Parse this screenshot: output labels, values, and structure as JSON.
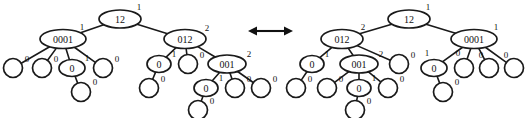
{
  "figure": {
    "background_color": "#ffffff",
    "stroke_color": "#1a1a1a",
    "text_color": "#111111",
    "width": 526,
    "height": 118
  },
  "relation_arrow": {
    "name": "double-headed-arrow",
    "label": "",
    "x1": 248,
    "x2": 293,
    "y": 31,
    "head_size": 7
  },
  "trees": [
    {
      "id": "left-tree",
      "name": "left-tree",
      "root_id": "L0",
      "nodes": [
        {
          "id": "L0",
          "label": "12",
          "shape": "ellipse",
          "cx": 120,
          "cy": 19,
          "rx": 21,
          "ry": 9,
          "edge_label": "1",
          "edge_label_x": 139,
          "edge_label_y": 7
        },
        {
          "id": "L1",
          "label": "0001",
          "shape": "ellipse",
          "cx": 63,
          "cy": 39,
          "rx": 23,
          "ry": 9.5,
          "edge_label": "1",
          "edge_label_x": 82,
          "edge_label_y": 27
        },
        {
          "id": "L2",
          "label": "012",
          "shape": "ellipse",
          "cx": 185,
          "cy": 39,
          "rx": 21,
          "ry": 9.5,
          "edge_label": "2",
          "edge_label_x": 207,
          "edge_label_y": 28
        },
        {
          "id": "L3",
          "label": "",
          "shape": "circle",
          "cx": 13,
          "cy": 68,
          "rx": 9.5,
          "ry": 9.5,
          "edge_label": "0",
          "edge_label_x": 27,
          "edge_label_y": 59
        },
        {
          "id": "L4",
          "label": "",
          "shape": "circle",
          "cx": 42,
          "cy": 68,
          "rx": 9.5,
          "ry": 9.5,
          "edge_label": "0",
          "edge_label_x": 56,
          "edge_label_y": 59
        },
        {
          "id": "L5",
          "label": "0",
          "shape": "ellipse",
          "cx": 72,
          "cy": 68,
          "rx": 13,
          "ry": 8.5,
          "edge_label": "1",
          "edge_label_x": 87,
          "edge_label_y": 58
        },
        {
          "id": "L6",
          "label": "",
          "shape": "circle",
          "cx": 103,
          "cy": 68,
          "rx": 9.5,
          "ry": 9.5,
          "edge_label": "0",
          "edge_label_x": 117,
          "edge_label_y": 59
        },
        {
          "id": "L7",
          "label": "",
          "shape": "circle",
          "cx": 81,
          "cy": 92,
          "rx": 9.5,
          "ry": 9.5,
          "edge_label": "0",
          "edge_label_x": 95,
          "edge_label_y": 82
        },
        {
          "id": "L8",
          "label": "0",
          "shape": "ellipse",
          "cx": 159,
          "cy": 64,
          "rx": 12,
          "ry": 8.5,
          "edge_label": "1",
          "edge_label_x": 174,
          "edge_label_y": 54
        },
        {
          "id": "L9",
          "label": "",
          "shape": "circle",
          "cx": 188,
          "cy": 64,
          "rx": 9.5,
          "ry": 9.5,
          "edge_label": "0",
          "edge_label_x": 202,
          "edge_label_y": 55
        },
        {
          "id": "L10",
          "label": "001",
          "shape": "ellipse",
          "cx": 227,
          "cy": 64,
          "rx": 19,
          "ry": 9,
          "edge_label": "2",
          "edge_label_x": 249,
          "edge_label_y": 54
        },
        {
          "id": "L11",
          "label": "",
          "shape": "circle",
          "cx": 149,
          "cy": 88,
          "rx": 9.5,
          "ry": 9.5,
          "edge_label": "0",
          "edge_label_x": 163,
          "edge_label_y": 79
        },
        {
          "id": "L12",
          "label": "0",
          "shape": "ellipse",
          "cx": 206,
          "cy": 88,
          "rx": 12,
          "ry": 8.5,
          "edge_label": "1",
          "edge_label_x": 221,
          "edge_label_y": 78
        },
        {
          "id": "L13",
          "label": "",
          "shape": "circle",
          "cx": 235,
          "cy": 88,
          "rx": 9.5,
          "ry": 9.5,
          "edge_label": "0",
          "edge_label_x": 249,
          "edge_label_y": 79
        },
        {
          "id": "L14",
          "label": "",
          "shape": "circle",
          "cx": 261,
          "cy": 88,
          "rx": 9.5,
          "ry": 9.5,
          "edge_label": "0",
          "edge_label_x": 275,
          "edge_label_y": 79
        },
        {
          "id": "L15",
          "label": "",
          "shape": "circle",
          "cx": 198,
          "cy": 110,
          "rx": 9.5,
          "ry": 9.5,
          "edge_label": "0",
          "edge_label_x": 212,
          "edge_label_y": 101
        }
      ],
      "edges": [
        {
          "from": "L0",
          "to": "L1"
        },
        {
          "from": "L0",
          "to": "L2"
        },
        {
          "from": "L1",
          "to": "L3"
        },
        {
          "from": "L1",
          "to": "L4"
        },
        {
          "from": "L1",
          "to": "L5"
        },
        {
          "from": "L1",
          "to": "L6"
        },
        {
          "from": "L5",
          "to": "L7"
        },
        {
          "from": "L2",
          "to": "L8"
        },
        {
          "from": "L2",
          "to": "L9"
        },
        {
          "from": "L2",
          "to": "L10"
        },
        {
          "from": "L8",
          "to": "L11"
        },
        {
          "from": "L10",
          "to": "L12"
        },
        {
          "from": "L10",
          "to": "L13"
        },
        {
          "from": "L10",
          "to": "L14"
        },
        {
          "from": "L12",
          "to": "L15"
        }
      ]
    },
    {
      "id": "right-tree",
      "name": "right-tree",
      "root_id": "R0",
      "nodes": [
        {
          "id": "R0",
          "label": "12",
          "shape": "ellipse",
          "cx": 409,
          "cy": 19,
          "rx": 21,
          "ry": 9,
          "edge_label": "1",
          "edge_label_x": 428,
          "edge_label_y": 7
        },
        {
          "id": "R1",
          "label": "012",
          "shape": "ellipse",
          "cx": 342,
          "cy": 39,
          "rx": 21,
          "ry": 9.5,
          "edge_label": "2",
          "edge_label_x": 363,
          "edge_label_y": 27
        },
        {
          "id": "R2",
          "label": "0001",
          "shape": "ellipse",
          "cx": 474,
          "cy": 39,
          "rx": 23,
          "ry": 9.5,
          "edge_label": "1",
          "edge_label_x": 496,
          "edge_label_y": 27
        },
        {
          "id": "R3",
          "label": "0",
          "shape": "ellipse",
          "cx": 312,
          "cy": 64,
          "rx": 12,
          "ry": 8.5,
          "edge_label": "1",
          "edge_label_x": 327,
          "edge_label_y": 54
        },
        {
          "id": "R4",
          "label": "001",
          "shape": "ellipse",
          "cx": 359,
          "cy": 64,
          "rx": 19,
          "ry": 9,
          "edge_label": "2",
          "edge_label_x": 381,
          "edge_label_y": 54
        },
        {
          "id": "R5",
          "label": "",
          "shape": "circle",
          "cx": 399,
          "cy": 64,
          "rx": 9.5,
          "ry": 9.5,
          "edge_label": "0",
          "edge_label_x": 413,
          "edge_label_y": 55
        },
        {
          "id": "R6",
          "label": "",
          "shape": "circle",
          "cx": 296,
          "cy": 88,
          "rx": 9.5,
          "ry": 9.5,
          "edge_label": "0",
          "edge_label_x": 310,
          "edge_label_y": 79
        },
        {
          "id": "R7",
          "label": "",
          "shape": "circle",
          "cx": 327,
          "cy": 88,
          "rx": 9.5,
          "ry": 9.5,
          "edge_label": "0",
          "edge_label_x": 341,
          "edge_label_y": 79
        },
        {
          "id": "R8",
          "label": "0",
          "shape": "ellipse",
          "cx": 359,
          "cy": 88,
          "rx": 12,
          "ry": 8.5,
          "edge_label": "1",
          "edge_label_x": 374,
          "edge_label_y": 78
        },
        {
          "id": "R9",
          "label": "",
          "shape": "circle",
          "cx": 388,
          "cy": 88,
          "rx": 9.5,
          "ry": 9.5,
          "edge_label": "0",
          "edge_label_x": 402,
          "edge_label_y": 79
        },
        {
          "id": "R10",
          "label": "",
          "shape": "circle",
          "cx": 355,
          "cy": 110,
          "rx": 9.5,
          "ry": 9.5,
          "edge_label": "0",
          "edge_label_x": 369,
          "edge_label_y": 101
        },
        {
          "id": "R11",
          "label": "0",
          "shape": "ellipse",
          "cx": 434,
          "cy": 68,
          "rx": 13,
          "ry": 8.5,
          "edge_label": "1",
          "edge_label_x": 427,
          "edge_label_y": 53
        },
        {
          "id": "R12",
          "label": "",
          "shape": "circle",
          "cx": 464,
          "cy": 68,
          "rx": 9.5,
          "ry": 9.5,
          "edge_label": "0",
          "edge_label_x": 458,
          "edge_label_y": 53
        },
        {
          "id": "R13",
          "label": "",
          "shape": "circle",
          "cx": 489,
          "cy": 68,
          "rx": 9.5,
          "ry": 9.5,
          "edge_label": "0",
          "edge_label_x": 481,
          "edge_label_y": 55
        },
        {
          "id": "R14",
          "label": "",
          "shape": "circle",
          "cx": 514,
          "cy": 68,
          "rx": 9.5,
          "ry": 9.5,
          "edge_label": "0",
          "edge_label_x": 506,
          "edge_label_y": 55
        },
        {
          "id": "R15",
          "label": "",
          "shape": "circle",
          "cx": 443,
          "cy": 92,
          "rx": 9.5,
          "ry": 9.5,
          "edge_label": "0",
          "edge_label_x": 457,
          "edge_label_y": 82
        }
      ],
      "edges": [
        {
          "from": "R0",
          "to": "R1"
        },
        {
          "from": "R0",
          "to": "R2"
        },
        {
          "from": "R1",
          "to": "R3"
        },
        {
          "from": "R1",
          "to": "R4"
        },
        {
          "from": "R1",
          "to": "R5"
        },
        {
          "from": "R3",
          "to": "R6"
        },
        {
          "from": "R4",
          "to": "R7"
        },
        {
          "from": "R4",
          "to": "R8"
        },
        {
          "from": "R4",
          "to": "R9"
        },
        {
          "from": "R8",
          "to": "R10"
        },
        {
          "from": "R2",
          "to": "R11"
        },
        {
          "from": "R2",
          "to": "R12"
        },
        {
          "from": "R2",
          "to": "R13"
        },
        {
          "from": "R2",
          "to": "R14"
        },
        {
          "from": "R11",
          "to": "R15"
        }
      ]
    }
  ],
  "typography": {
    "node_font_size": 10,
    "edge_font_size": 9
  }
}
